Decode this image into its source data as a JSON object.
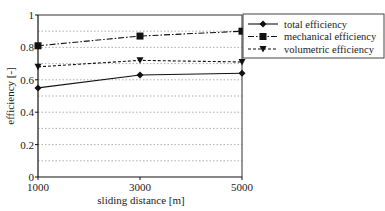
{
  "chart_data": {
    "type": "line",
    "title": "",
    "xlabel": "sliding distance [m]",
    "ylabel": "efficiency [-]",
    "x": [
      1000,
      3000,
      5000
    ],
    "xticks": [
      "1000",
      "3000",
      "5000"
    ],
    "yticks": [
      "0",
      "0.2",
      "0.4",
      "0.6",
      "0.8",
      "1"
    ],
    "ylim": [
      0,
      1
    ],
    "grid": "horizontal dotted every 0.1",
    "legend_position": "right",
    "series": [
      {
        "name": "total efficiency",
        "marker": "diamond",
        "line": "solid",
        "values": [
          0.55,
          0.63,
          0.64
        ]
      },
      {
        "name": "mechanical efficiency",
        "marker": "square",
        "line": "dash-dot",
        "values": [
          0.81,
          0.87,
          0.9
        ]
      },
      {
        "name": "volumetric efficiency",
        "marker": "triangle-down",
        "line": "dashed",
        "values": [
          0.68,
          0.72,
          0.71
        ]
      }
    ]
  }
}
